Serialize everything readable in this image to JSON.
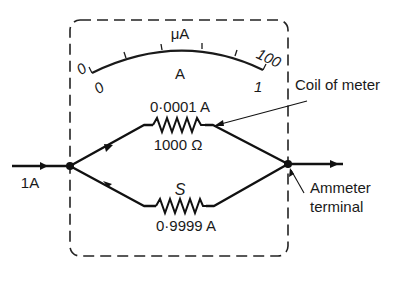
{
  "meter": {
    "scale_top_unit": "μA",
    "scale_bottom_unit": "A",
    "top_min": "0",
    "top_max": "100",
    "bottom_min": "0",
    "bottom_max": "1"
  },
  "coil_branch": {
    "current": "0·0001 A",
    "resistance": "1000 Ω"
  },
  "shunt_branch": {
    "symbol": "S",
    "current": "0·9999 A"
  },
  "input_current": "1A",
  "annotations": {
    "coil": "Coil of meter",
    "terminal_line1": "Ammeter",
    "terminal_line2": "terminal"
  },
  "colors": {
    "ink": "#1a1a1a",
    "background": "#ffffff"
  }
}
